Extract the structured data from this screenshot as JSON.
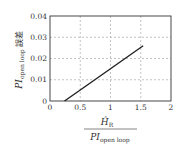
{
  "chart_data": {
    "type": "line",
    "title": "",
    "xlabel": "Ĥ_R / PI_open loop",
    "xlabel_numerator": "Ĥ",
    "xlabel_numerator_sub": "R",
    "xlabel_denominator": "PI",
    "xlabel_denominator_sub": "open loop",
    "ylabel": "PI_open loop 誤差",
    "ylabel_main": "PI",
    "ylabel_sub": "open loop",
    "ylabel_suffix": "誤差",
    "xlim": [
      0,
      2
    ],
    "ylim": [
      0,
      0.04
    ],
    "xticks": [
      "0",
      "0.5",
      "1",
      "1.5",
      "2"
    ],
    "yticks": [
      "0",
      "0.01",
      "0.02",
      "0.03",
      "0.04"
    ],
    "grid": true,
    "legend": null,
    "series": [
      {
        "name": "error",
        "color": "#222222",
        "x": [
          0.24,
          0.5,
          1.0,
          1.54
        ],
        "y": [
          0.0,
          0.0052,
          0.0152,
          0.026
        ]
      }
    ]
  }
}
